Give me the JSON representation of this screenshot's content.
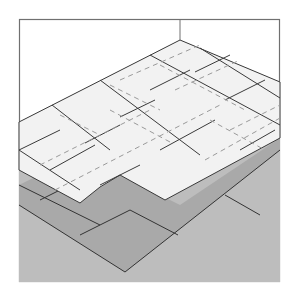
{
  "figure": {
    "caption": "Floor tile layout illustration",
    "colors": {
      "background": "#ffffff",
      "frame": "#707070",
      "tile": "#f1f1f1",
      "tile_line": "#3a3a3a",
      "dashed_line": "#9a9a9a",
      "underlay_dark": "#a8a8a8",
      "underlay_light": "#bdbdbd"
    }
  }
}
